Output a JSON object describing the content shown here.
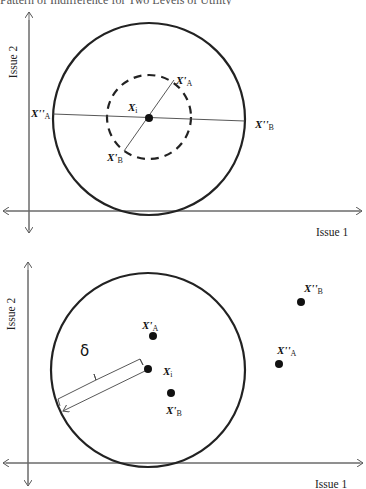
{
  "caption": "Pattern of Indifference for Two Levels of Utility",
  "top_diagram": {
    "x_axis_label": "Issue 1",
    "y_axis_label": "Issue 2",
    "ideal_point": {
      "name": "X",
      "sub": "i"
    },
    "points": {
      "x_prime_a": {
        "name": "X'",
        "sub": "A"
      },
      "x_prime_b": {
        "name": "X'",
        "sub": "B"
      },
      "x_dprime_a": {
        "name": "X''",
        "sub": "A"
      },
      "x_dprime_b": {
        "name": "X''",
        "sub": "B"
      }
    }
  },
  "bottom_diagram": {
    "x_axis_label": "Issue 1",
    "y_axis_label": "Issue 2",
    "radius_label": "δ",
    "ideal_point": {
      "name": "X",
      "sub": "i"
    },
    "points": {
      "x_prime_a": {
        "name": "X'",
        "sub": "A"
      },
      "x_prime_b": {
        "name": "X'",
        "sub": "B"
      },
      "x_dprime_a": {
        "name": "X''",
        "sub": "A"
      },
      "x_dprime_b": {
        "name": "X''",
        "sub": "B"
      }
    }
  }
}
